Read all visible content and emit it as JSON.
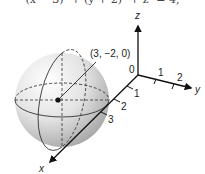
{
  "top_equation_fragment": "(x − 3)² + (y + 2)² + z² = 4,",
  "axes": {
    "x_label": "x",
    "y_label": "y",
    "z_label": "z",
    "origin_label": "0",
    "x_ticks": [
      "1",
      "2",
      "3"
    ],
    "y_ticks": [
      "1",
      "2"
    ]
  },
  "sphere": {
    "center_label": "(3, −2, 0)",
    "shading_color": "#cfcfcf"
  }
}
